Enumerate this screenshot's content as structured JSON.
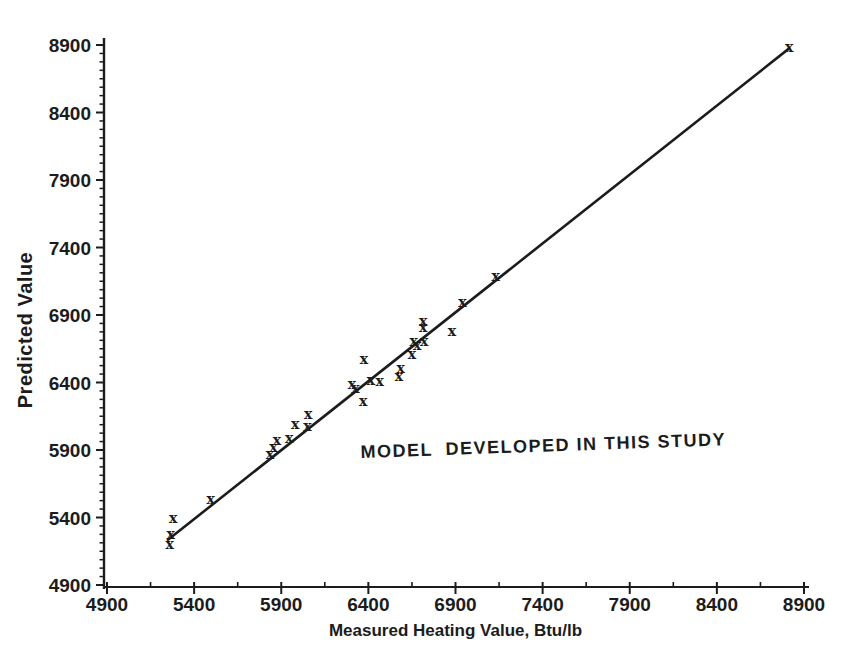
{
  "figure": {
    "background": "#ffffff",
    "ink_color": "#1c1c1c"
  },
  "chart_data": {
    "type": "scatter",
    "title": "",
    "xlabel": "Measured Heating Value, Btu/lb",
    "ylabel": "Predicted Value",
    "xlim": [
      4900,
      8900
    ],
    "ylim": [
      4900,
      8900
    ],
    "x_ticks": [
      4900,
      5400,
      5900,
      6400,
      6900,
      7400,
      7900,
      8400,
      8900
    ],
    "y_ticks": [
      4900,
      5400,
      5900,
      6400,
      6900,
      7400,
      7900,
      8400,
      8900
    ],
    "x_minor_step": 250,
    "y_minor_step": 62.5,
    "grid": false,
    "legend": null,
    "marker": "x",
    "ink_color": "#1c1c1c",
    "annotation": {
      "text": "MODEL  DEVELOPED IN THIS STUDY",
      "x": 6355,
      "y": 5885
    },
    "series": [
      {
        "name": "measured-vs-predicted",
        "points": [
          [
            5260,
            5190
          ],
          [
            5265,
            5270
          ],
          [
            5280,
            5385
          ],
          [
            5495,
            5525
          ],
          [
            5835,
            5860
          ],
          [
            5855,
            5915
          ],
          [
            5875,
            5965
          ],
          [
            5945,
            5980
          ],
          [
            5980,
            6080
          ],
          [
            6050,
            6065
          ],
          [
            6055,
            6160
          ],
          [
            6305,
            6380
          ],
          [
            6325,
            6350
          ],
          [
            6370,
            6255
          ],
          [
            6375,
            6565
          ],
          [
            6415,
            6410
          ],
          [
            6465,
            6400
          ],
          [
            6575,
            6440
          ],
          [
            6585,
            6495
          ],
          [
            6650,
            6600
          ],
          [
            6660,
            6700
          ],
          [
            6680,
            6665
          ],
          [
            6720,
            6695
          ],
          [
            6715,
            6845
          ],
          [
            6715,
            6800
          ],
          [
            6880,
            6770
          ],
          [
            6940,
            6985
          ],
          [
            7130,
            7180
          ],
          [
            8815,
            8875
          ]
        ]
      }
    ],
    "fit_line": {
      "x1": 5250,
      "y1": 5235,
      "x2": 8815,
      "y2": 8875
    }
  }
}
